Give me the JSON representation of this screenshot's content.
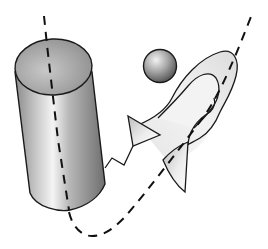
{
  "diagram": {
    "description": "Illustration of geometric 3D objects linked by a dashed axis path",
    "colors": {
      "stroke": "#1a1a1a",
      "background": "#ffffff",
      "shade_dark": "#7a7a7a",
      "shade_mid": "#b8b8b8",
      "shade_light": "#f0f0f0"
    },
    "objects": [
      {
        "id": "cylinder",
        "label": "cylinder"
      },
      {
        "id": "sphere",
        "label": "sphere"
      },
      {
        "id": "triangle",
        "label": "triangle"
      },
      {
        "id": "ribbon",
        "label": "twisted ribbon"
      },
      {
        "id": "zigzag",
        "label": "zigzag connector"
      },
      {
        "id": "axis",
        "label": "dashed axis path"
      }
    ]
  }
}
